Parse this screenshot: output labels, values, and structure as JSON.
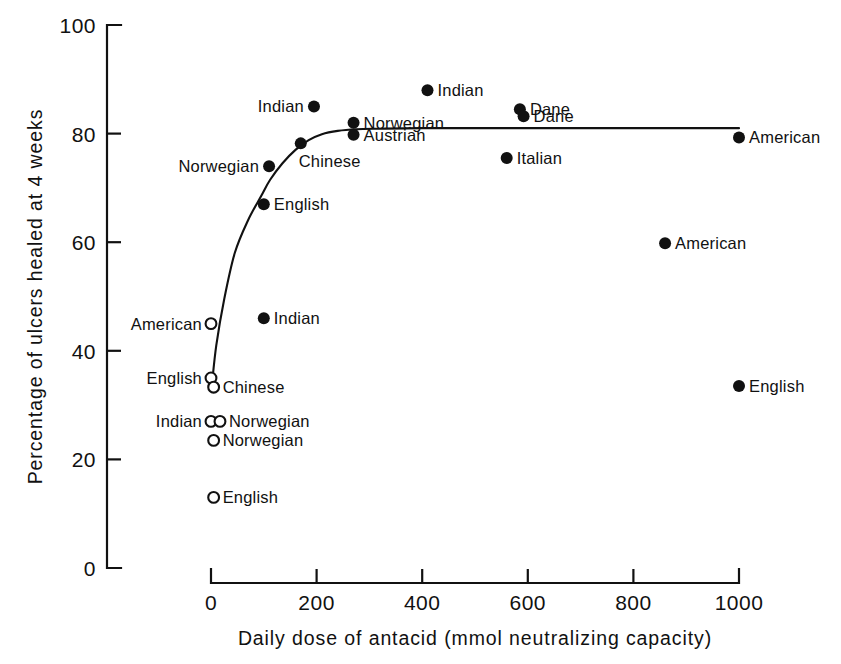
{
  "chart_data": {
    "type": "scatter",
    "title": "",
    "subtitle": "",
    "xlabel": "Daily dose of antacid (mmol neutralizing capacity)",
    "ylabel": "Percentage of ulcers healed at 4 weeks",
    "xlim": [
      0,
      1000
    ],
    "ylim": [
      0,
      100
    ],
    "xticks": [
      0,
      200,
      400,
      600,
      800,
      1000
    ],
    "xticklabels": [
      "0",
      "200",
      "400",
      "600",
      "800",
      "1000"
    ],
    "yticks": [
      0,
      20,
      40,
      60,
      80,
      100
    ],
    "yticklabels": [
      "0",
      "20",
      "40",
      "60",
      "80",
      "100"
    ],
    "grid": false,
    "legend": "none",
    "marker_types": {
      "filled": "antacid treated group",
      "open": "placebo / control group"
    },
    "series": [
      {
        "name": "Antacid groups (filled circles)",
        "marker": "filled",
        "points": [
          {
            "label": "Indian",
            "x": 195,
            "y": 85.0,
            "label_side": "left"
          },
          {
            "label": "Indian",
            "x": 410,
            "y": 88.0,
            "label_side": "right"
          },
          {
            "label": "Norwegian",
            "x": 270,
            "y": 82.0,
            "label_side": "right"
          },
          {
            "label": "Austrian",
            "x": 270,
            "y": 79.8,
            "label_side": "right"
          },
          {
            "label": "Dane",
            "x": 585,
            "y": 84.5,
            "label_side": "right"
          },
          {
            "label": "Dane",
            "x": 592,
            "y": 83.2,
            "label_side": "right"
          },
          {
            "label": "American",
            "x": 1000,
            "y": 79.3,
            "label_side": "right"
          },
          {
            "label": "Italian",
            "x": 560,
            "y": 75.5,
            "label_side": "right"
          },
          {
            "label": "Chinese",
            "x": 170,
            "y": 78.2,
            "label_side": "below"
          },
          {
            "label": "Norwegian",
            "x": 110,
            "y": 74.0,
            "label_side": "left"
          },
          {
            "label": "English",
            "x": 100,
            "y": 67.0,
            "label_side": "right"
          },
          {
            "label": "American",
            "x": 860,
            "y": 59.8,
            "label_side": "right"
          },
          {
            "label": "Indian",
            "x": 100,
            "y": 46.0,
            "label_side": "right"
          },
          {
            "label": "English",
            "x": 1000,
            "y": 33.5,
            "label_side": "right"
          }
        ]
      },
      {
        "name": "Placebo groups (open circles)",
        "marker": "open",
        "points": [
          {
            "label": "American",
            "x": 0,
            "y": 45.0,
            "label_side": "left"
          },
          {
            "label": "English",
            "x": 0,
            "y": 35.0,
            "label_side": "left"
          },
          {
            "label": "Chinese",
            "x": 5,
            "y": 33.3,
            "label_side": "right"
          },
          {
            "label": "Indian",
            "x": 0,
            "y": 27.0,
            "label_side": "left"
          },
          {
            "label": "Norwegian",
            "x": 17,
            "y": 27.0,
            "label_side": "right"
          },
          {
            "label": "Norwegian",
            "x": 5,
            "y": 23.5,
            "label_side": "right"
          },
          {
            "label": "English",
            "x": 5,
            "y": 13.0,
            "label_side": "right"
          }
        ]
      }
    ],
    "fit_curve": {
      "name": "fitted dose-response curve",
      "x": [
        2,
        10,
        25,
        45,
        70,
        95,
        112,
        135,
        160,
        185,
        210,
        240,
        275,
        320,
        400,
        520,
        650,
        800,
        1000
      ],
      "y": [
        34.0,
        41.0,
        49.5,
        58.0,
        64.0,
        68.5,
        71.5,
        74.5,
        77.0,
        78.8,
        79.9,
        80.5,
        80.8,
        80.9,
        81.0,
        81.0,
        81.0,
        81.0,
        81.0
      ]
    }
  },
  "colors": {
    "ink": "#111111",
    "background": "#ffffff"
  }
}
